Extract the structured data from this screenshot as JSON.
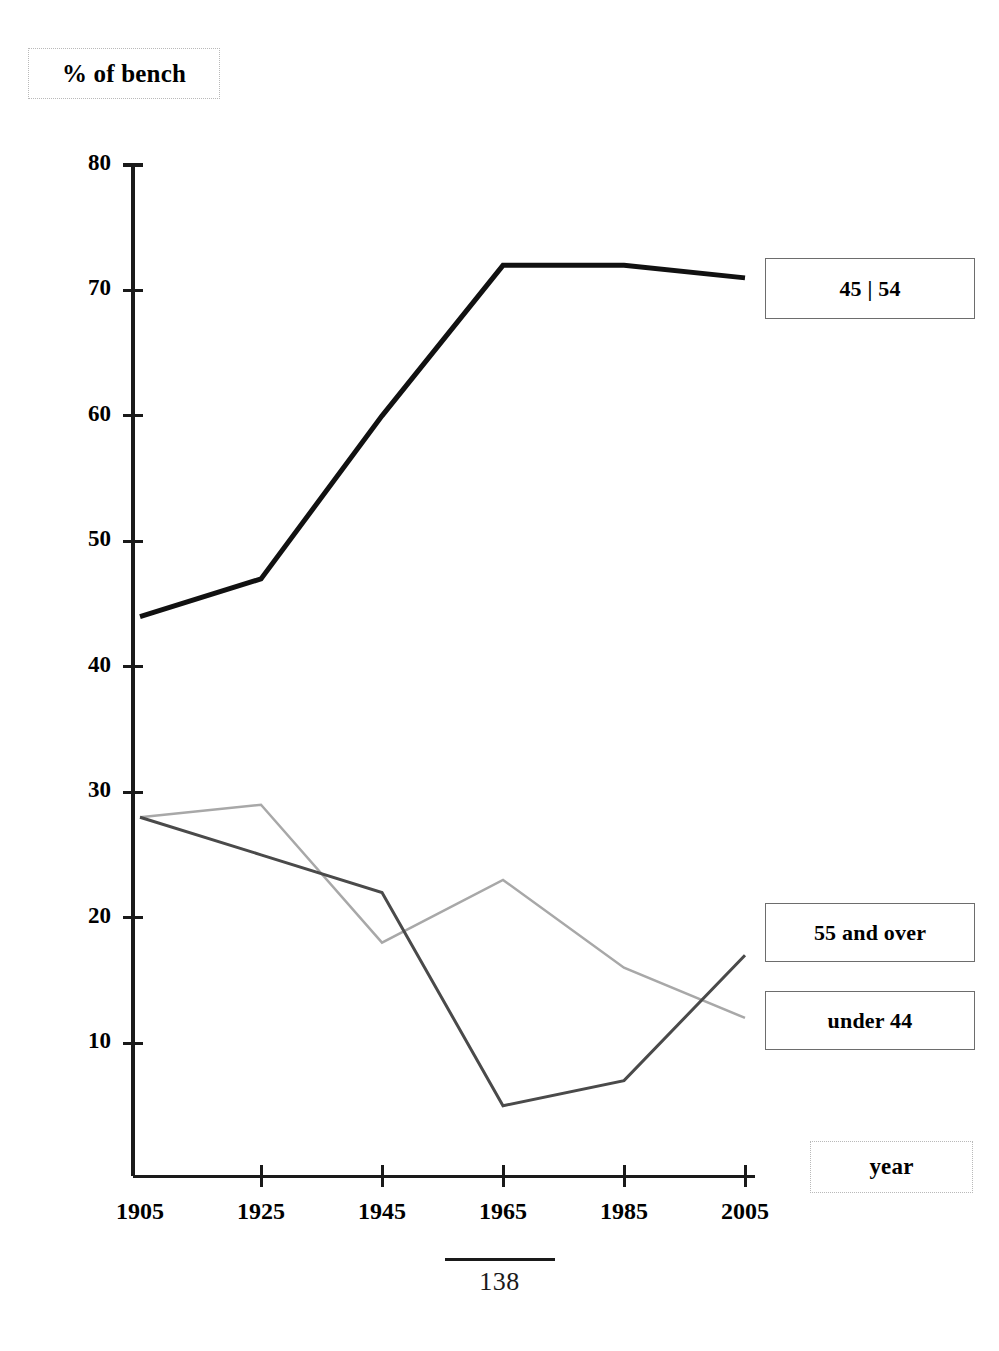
{
  "title": {
    "text": "% of bench"
  },
  "axis": {
    "x_label": "year",
    "y_ticks": [
      "80",
      "70",
      "60",
      "50",
      "40",
      "30",
      "20",
      "10"
    ],
    "x_ticks": [
      "1905",
      "1925",
      "1945",
      "1965",
      "1985",
      "2005"
    ]
  },
  "legend": {
    "series_1": "45 | 54",
    "series_2": "55 and over",
    "series_3": "under 44"
  },
  "footer": {
    "page_number": "138"
  },
  "colors": {
    "series_1": "#111111",
    "series_2": "#a8a8a8",
    "series_3": "#4a4a4a",
    "axis": "#1a1a1a"
  },
  "chart_data": {
    "type": "line",
    "title": "% of bench",
    "xlabel": "year",
    "ylabel": "% of bench",
    "x": [
      1905,
      1925,
      1945,
      1965,
      1985,
      2005
    ],
    "xlim": [
      1905,
      2005
    ],
    "ylim": [
      0,
      80
    ],
    "yticks": [
      10,
      20,
      30,
      40,
      50,
      60,
      70,
      80
    ],
    "grid": false,
    "legend_position": "right-inline-boxes",
    "series": [
      {
        "name": "45 | 54",
        "values": [
          44,
          47,
          60,
          72,
          72,
          71
        ],
        "color": "#111111",
        "width": 5
      },
      {
        "name": "55 and over",
        "values": [
          28,
          29,
          18,
          23,
          16,
          12
        ],
        "color": "#a8a8a8",
        "width": 2.5
      },
      {
        "name": "under 44",
        "values": [
          28,
          25,
          22,
          5,
          7,
          17
        ],
        "color": "#4a4a4a",
        "width": 3
      }
    ]
  }
}
